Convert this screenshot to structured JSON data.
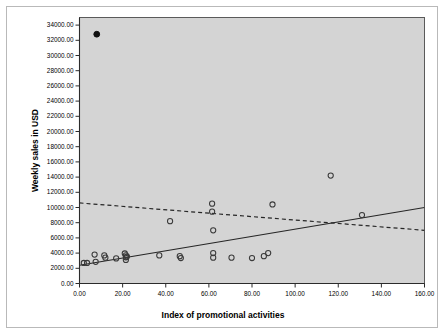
{
  "chart_data": {
    "type": "scatter",
    "title": "",
    "xlabel": "Index of promotional activities",
    "ylabel": "Weekly sales in USD",
    "xlim": [
      0,
      160
    ],
    "ylim": [
      0,
      35000
    ],
    "xticks": [
      "0.00",
      "20.00",
      "40.00",
      "60.00",
      "80.00",
      "100.00",
      "120.00",
      "140.00",
      "160.00"
    ],
    "xtick_values": [
      0,
      20,
      40,
      60,
      80,
      100,
      120,
      140,
      160
    ],
    "yticks": [
      "0.00",
      "2000.00",
      "4000.00",
      "6000.00",
      "8000.00",
      "10000.00",
      "12000.00",
      "14000.00",
      "16000.00",
      "18000.00",
      "20000.00",
      "22000.00",
      "24000.00",
      "26000.00",
      "28000.00",
      "30000.00",
      "32000.00",
      "34000.00"
    ],
    "ytick_values": [
      0,
      2000,
      4000,
      6000,
      8000,
      10000,
      12000,
      14000,
      16000,
      18000,
      20000,
      22000,
      24000,
      26000,
      28000,
      30000,
      32000,
      34000
    ],
    "grid": false,
    "legend": "none",
    "plot_background": "#d4d4d4",
    "marker_style": "open-circle",
    "marker_color": "#3a3a3a",
    "points": [
      {
        "x": 2.0,
        "y": 2700
      },
      {
        "x": 3.5,
        "y": 2700
      },
      {
        "x": 7.0,
        "y": 3800
      },
      {
        "x": 7.5,
        "y": 2850
      },
      {
        "x": 11.5,
        "y": 3700
      },
      {
        "x": 12.0,
        "y": 3400
      },
      {
        "x": 17.0,
        "y": 3300
      },
      {
        "x": 21.0,
        "y": 3950
      },
      {
        "x": 21.5,
        "y": 3700
      },
      {
        "x": 21.5,
        "y": 3450
      },
      {
        "x": 21.5,
        "y": 3100
      },
      {
        "x": 22.0,
        "y": 3550
      },
      {
        "x": 37.0,
        "y": 3700
      },
      {
        "x": 42.0,
        "y": 8200
      },
      {
        "x": 46.5,
        "y": 3600
      },
      {
        "x": 47.0,
        "y": 3350
      },
      {
        "x": 61.5,
        "y": 10500
      },
      {
        "x": 61.5,
        "y": 9450
      },
      {
        "x": 62.0,
        "y": 7000
      },
      {
        "x": 62.0,
        "y": 4000
      },
      {
        "x": 62.0,
        "y": 3400
      },
      {
        "x": 70.5,
        "y": 3400
      },
      {
        "x": 80.0,
        "y": 3350
      },
      {
        "x": 85.5,
        "y": 3600
      },
      {
        "x": 87.5,
        "y": 4000
      },
      {
        "x": 89.5,
        "y": 10400
      },
      {
        "x": 116.5,
        "y": 14200
      },
      {
        "x": 131.0,
        "y": 9000
      }
    ],
    "outlier_points": [
      {
        "x": 8.0,
        "y": 32800,
        "style": "filled-circle"
      }
    ],
    "lines": [
      {
        "name": "solid-fit-line",
        "style": "solid",
        "color": "#262626",
        "x1": 0,
        "y1": 2400,
        "x2": 160,
        "y2": 10000
      },
      {
        "name": "dashed-fit-line",
        "style": "dashed",
        "color": "#262626",
        "x1": 0,
        "y1": 10600,
        "x2": 160,
        "y2": 7000
      }
    ]
  }
}
